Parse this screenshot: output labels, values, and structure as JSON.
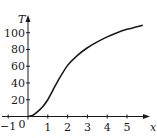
{
  "chart_data": {
    "type": "line",
    "title": "",
    "xlabel": "x",
    "ylabel": "T",
    "xlim": [
      -1,
      6
    ],
    "ylim": [
      0,
      110
    ],
    "grid": false,
    "legend": null,
    "x_ticks": [
      -1,
      0,
      1,
      2,
      3,
      4,
      5
    ],
    "x_tick_labels": [
      "−1",
      "0",
      "1",
      "2",
      "3",
      "4",
      "5"
    ],
    "y_ticks": [
      20,
      40,
      60,
      80,
      100
    ],
    "y_tick_labels": [
      "20",
      "40",
      "60",
      "80",
      "100"
    ],
    "series": [
      {
        "name": "T(x)",
        "x": [
          0,
          0.25,
          0.5,
          0.75,
          1,
          1.25,
          1.5,
          2,
          2.5,
          3,
          3.5,
          4,
          4.5,
          5,
          5.5,
          5.8
        ],
        "y": [
          0,
          1.5,
          6,
          12,
          20,
          31,
          42,
          61,
          73,
          82,
          89,
          95,
          100,
          104,
          107,
          109
        ],
        "color": "#1a1a1a"
      }
    ]
  },
  "axes": {
    "x_label": "x",
    "y_label": "T",
    "origin_label": "0"
  }
}
